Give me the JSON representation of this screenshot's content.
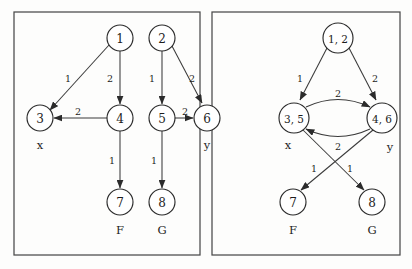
{
  "figure": {
    "title": "",
    "background_color": "#fdfdfc",
    "stroke_color": "#3a3a3a",
    "panels": [
      {
        "id": "left",
        "name": "original-graph",
        "frame": {
          "x": 14,
          "y": 12,
          "width": 186,
          "height": 243
        },
        "nodes": [
          {
            "id": "n1",
            "label": "1",
            "cx": 120,
            "cy": 38,
            "r": 13
          },
          {
            "id": "n2",
            "label": "2",
            "cx": 162,
            "cy": 38,
            "r": 13
          },
          {
            "id": "n3",
            "label": "3",
            "cx": 40,
            "cy": 118,
            "r": 13
          },
          {
            "id": "n4",
            "label": "4",
            "cx": 120,
            "cy": 118,
            "r": 13
          },
          {
            "id": "n5",
            "label": "5",
            "cx": 162,
            "cy": 118,
            "r": 13
          },
          {
            "id": "n6",
            "label": "6",
            "cx": 207,
            "cy": 118,
            "r": 13
          },
          {
            "id": "n7",
            "label": "7",
            "cx": 120,
            "cy": 202,
            "r": 13
          },
          {
            "id": "n8",
            "label": "8",
            "cx": 162,
            "cy": 202,
            "r": 13
          }
        ],
        "edges": [
          {
            "from": "n1",
            "to": "n3",
            "weight": "1",
            "label_x": 68,
            "label_y": 78
          },
          {
            "from": "n1",
            "to": "n4",
            "weight": "2",
            "label_x": 110,
            "label_y": 78
          },
          {
            "from": "n2",
            "to": "n5",
            "weight": "1",
            "label_x": 152,
            "label_y": 78
          },
          {
            "from": "n2",
            "to": "n6",
            "weight": "2",
            "label_x": 192,
            "label_y": 78
          },
          {
            "from": "n4",
            "to": "n3",
            "weight": "2",
            "label_x": 78,
            "label_y": 111
          },
          {
            "from": "n5",
            "to": "n6",
            "weight": "2",
            "label_x": 185,
            "label_y": 111
          },
          {
            "from": "n4",
            "to": "n7",
            "weight": "1",
            "label_x": 112,
            "label_y": 160
          },
          {
            "from": "n5",
            "to": "n8",
            "weight": "1",
            "label_x": 154,
            "label_y": 160
          }
        ],
        "annotations": [
          {
            "text": "x",
            "x": 40,
            "y": 145
          },
          {
            "text": "y",
            "x": 207,
            "y": 145
          },
          {
            "text": "F",
            "x": 120,
            "y": 230
          },
          {
            "text": "G",
            "x": 162,
            "y": 230
          }
        ]
      },
      {
        "id": "right",
        "name": "merged-graph",
        "frame": {
          "x": 212,
          "y": 12,
          "width": 188,
          "height": 243
        },
        "nodes": [
          {
            "id": "m12",
            "label": "1, 2",
            "cx": 338,
            "cy": 38,
            "r": 15
          },
          {
            "id": "m35",
            "label": "3, 5",
            "cx": 294,
            "cy": 118,
            "r": 15
          },
          {
            "id": "m46",
            "label": "4, 6",
            "cx": 382,
            "cy": 118,
            "r": 15
          },
          {
            "id": "m7",
            "label": "7",
            "cx": 293,
            "cy": 202,
            "r": 13
          },
          {
            "id": "m8",
            "label": "8",
            "cx": 372,
            "cy": 202,
            "r": 13
          }
        ],
        "edges": [
          {
            "from": "m12",
            "to": "m35",
            "weight": "1",
            "label_x": 300,
            "label_y": 78
          },
          {
            "from": "m12",
            "to": "m46",
            "weight": "2",
            "label_x": 375,
            "label_y": 78
          },
          {
            "from": "m35",
            "to": "m46",
            "weight": "2",
            "label_x": 338,
            "label_y": 93,
            "curved": true
          },
          {
            "from": "m46",
            "to": "m35",
            "weight": "2",
            "label_x": 338,
            "label_y": 146,
            "curved": true
          },
          {
            "from": "m35",
            "to": "m8",
            "weight": "1",
            "label_x": 350,
            "label_y": 168
          },
          {
            "from": "m46",
            "to": "m7",
            "weight": "1",
            "label_x": 314,
            "label_y": 168
          }
        ],
        "annotations": [
          {
            "text": "x",
            "x": 288,
            "y": 145
          },
          {
            "text": "y",
            "x": 390,
            "y": 147
          },
          {
            "text": "F",
            "x": 293,
            "y": 230
          },
          {
            "text": "G",
            "x": 372,
            "y": 230
          }
        ]
      }
    ]
  }
}
